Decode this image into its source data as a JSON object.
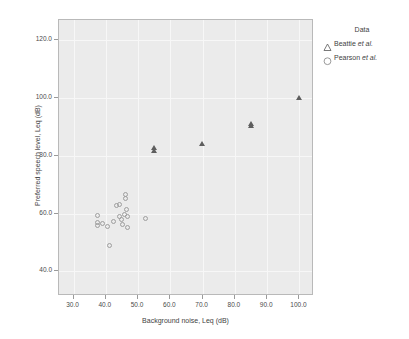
{
  "chart_data": {
    "type": "scatter",
    "title": "",
    "xlabel": "Background noise, Leq (dB)",
    "ylabel": "Preferred speech level, Leq (dB)",
    "xlim": [
      25.5,
      104.5
    ],
    "ylim": [
      31.5,
      127.0
    ],
    "xticks": [
      "30.0",
      "40.0",
      "50.0",
      "60.0",
      "70.0",
      "80.0",
      "90.0",
      "100.0"
    ],
    "xtick_values": [
      30,
      40,
      50,
      60,
      70,
      80,
      90,
      100
    ],
    "yticks": [
      "40.0",
      "60.0",
      "80.0",
      "100.0",
      "120.0"
    ],
    "ytick_values": [
      40,
      60,
      80,
      100,
      120
    ],
    "grid": true,
    "legend_position": "right",
    "legend_title": "Data",
    "series": [
      {
        "name": "Beattie et al.",
        "marker": "triangle",
        "color": "#5e5e5e",
        "points": [
          {
            "x": 55.0,
            "y": 82.8
          },
          {
            "x": 55.0,
            "y": 81.7
          },
          {
            "x": 70.0,
            "y": 84.3
          },
          {
            "x": 85.0,
            "y": 91.2
          },
          {
            "x": 85.0,
            "y": 90.2
          },
          {
            "x": 100.0,
            "y": 100.2
          }
        ]
      },
      {
        "name": "Pearson et al.",
        "marker": "circle",
        "color": "#9e9e9e",
        "points": [
          {
            "x": 37.5,
            "y": 59.3
          },
          {
            "x": 37.6,
            "y": 56.8
          },
          {
            "x": 37.7,
            "y": 55.8
          },
          {
            "x": 39.2,
            "y": 56.3
          },
          {
            "x": 40.6,
            "y": 55.4
          },
          {
            "x": 41.2,
            "y": 48.9
          },
          {
            "x": 42.5,
            "y": 57.2
          },
          {
            "x": 43.5,
            "y": 62.8
          },
          {
            "x": 44.3,
            "y": 62.9
          },
          {
            "x": 44.5,
            "y": 58.7
          },
          {
            "x": 45.0,
            "y": 57.8
          },
          {
            "x": 45.3,
            "y": 55.9
          },
          {
            "x": 45.8,
            "y": 59.6
          },
          {
            "x": 46.3,
            "y": 66.5
          },
          {
            "x": 46.4,
            "y": 65.2
          },
          {
            "x": 46.6,
            "y": 61.3
          },
          {
            "x": 46.8,
            "y": 58.9
          },
          {
            "x": 47.0,
            "y": 54.9
          },
          {
            "x": 52.3,
            "y": 58.3
          }
        ]
      }
    ]
  },
  "legend": {
    "title": "Data",
    "entries": [
      {
        "label_main": "Beattie ",
        "label_italic": "et al.",
        "symbol": "triangle-icon"
      },
      {
        "label_main": "Pearson ",
        "label_italic": "et al.",
        "symbol": "circle-icon"
      }
    ]
  },
  "colors": {
    "plot_background": "#ebebeb",
    "frame": "#b9b9b9",
    "gridline": "#f7f7f7",
    "triangle_marker": "#5e5e5e",
    "circle_marker": "#9e9e9e",
    "text": "#3f3f3f"
  }
}
